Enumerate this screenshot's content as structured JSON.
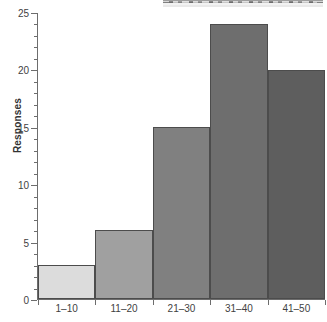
{
  "chart_data": {
    "type": "bar",
    "title": "",
    "subtitle": "",
    "xlabel": "",
    "ylabel": "Responses",
    "categories": [
      "1–10",
      "11–20",
      "21–30",
      "31–40",
      "41–50"
    ],
    "values": [
      3,
      6,
      15,
      24,
      20
    ],
    "series": [
      {
        "name": "Responses",
        "values": [
          3,
          6,
          15,
          24,
          20
        ]
      }
    ],
    "ylim": [
      0,
      25
    ],
    "xlim_categories": 5,
    "y_major_ticks": [
      0,
      5,
      10,
      15,
      20,
      25
    ],
    "y_major_tick_labels": [
      "0",
      "5",
      "10",
      "15",
      "20",
      "25"
    ],
    "y_minor_tick_step": 1,
    "grid": false,
    "legend": null,
    "legend_position": "none",
    "bar_gap": 0,
    "bar_colors": [
      "#dcdcdc",
      "#a0a0a0",
      "#808080",
      "#6e6e6e",
      "#5e5e5e"
    ],
    "bar_edge_color": "#4c4c4c",
    "axis_color": "#6d6d6d",
    "text_color": "#3f3f3f",
    "background_color": "#ffffff",
    "annotations": []
  },
  "artifact": {
    "description": "clipped-image-strip"
  }
}
